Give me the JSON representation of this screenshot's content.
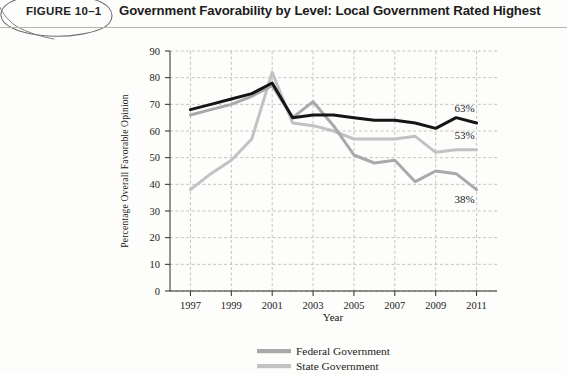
{
  "header": {
    "figure_number": "FIGURE 10–1",
    "title": "Government Favorability by Level: Local Government Rated Highest",
    "annotation": "hand-drawn-oval"
  },
  "chart_data": {
    "type": "line",
    "title": "Government Favorability by Level: Local Government Rated Highest",
    "xlabel": "Year",
    "ylabel": "Percentage Overall Favorable Opinion",
    "xlim": [
      1996,
      2012
    ],
    "ylim": [
      0,
      90
    ],
    "ytick_step": 10,
    "yticks": [
      "0",
      "10",
      "20",
      "30",
      "40",
      "50",
      "60",
      "70",
      "80",
      "90"
    ],
    "xticks": [
      "1997",
      "1999",
      "2001",
      "2003",
      "2005",
      "2007",
      "2009",
      "2011"
    ],
    "grid": true,
    "grid_style": "dashed",
    "legend_position": "bottom-center",
    "x": [
      1997,
      1998,
      1999,
      2000,
      2001,
      2002,
      2003,
      2004,
      2005,
      2006,
      2007,
      2008,
      2009,
      2010,
      2011
    ],
    "series": [
      {
        "name": "Local Government",
        "color": "#151515",
        "end_label": "63%",
        "end_value": 63,
        "values": [
          68,
          70,
          72,
          74,
          78,
          65,
          66,
          66,
          65,
          64,
          64,
          63,
          61,
          65,
          63
        ]
      },
      {
        "name": "Federal Government",
        "color": "#a9a9a9",
        "end_label": "38%",
        "end_value": 38,
        "values": [
          66,
          68,
          70,
          73,
          77,
          65,
          71,
          62,
          51,
          48,
          49,
          41,
          45,
          44,
          38
        ]
      },
      {
        "name": "State Government",
        "color": "#c2c2c2",
        "end_label": "53%",
        "end_value": 53,
        "values": [
          38,
          44,
          49,
          57,
          82,
          63,
          62,
          60,
          57,
          57,
          57,
          58,
          52,
          53,
          53
        ]
      }
    ]
  },
  "legend": {
    "items": [
      {
        "label": "Federal Government",
        "color": "#a9a9a9"
      },
      {
        "label": "State Government",
        "color": "#c2c2c2"
      }
    ]
  },
  "colors": {
    "local_line": "#151515",
    "federal_line": "#a9a9a9",
    "state_line": "#c2c2c2",
    "grid": "#b5b5b5",
    "axis": "#2a2a2a",
    "page_background": "#fdfdfb"
  }
}
